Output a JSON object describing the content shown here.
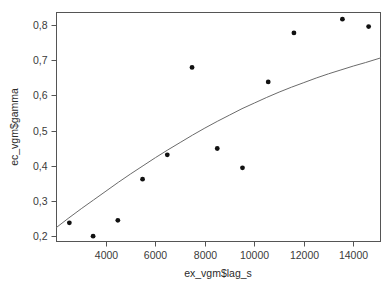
{
  "chart_data": {
    "type": "scatter",
    "title": "",
    "xlabel": "ex_vgm$lag_s",
    "ylabel": "ec_vgm$gamma",
    "xlim": [
      2000,
      15100
    ],
    "ylim": [
      0.185,
      0.835
    ],
    "grid": false,
    "legend": null,
    "decimal_separator": ",",
    "xticks": [
      4000,
      6000,
      8000,
      10000,
      12000,
      14000
    ],
    "xtick_labels": [
      "4000",
      "6000",
      "8000",
      "10000",
      "12000",
      "14000"
    ],
    "yticks": [
      0.2,
      0.3,
      0.4,
      0.5,
      0.6,
      0.7,
      0.8
    ],
    "ytick_labels": [
      "0,2",
      "0,3",
      "0,4",
      "0,5",
      "0,6",
      "0,7",
      "0,8"
    ],
    "series": [
      {
        "name": "empirical variogram",
        "type": "scatter",
        "marker": "filled-circle",
        "color": "#111111",
        "x": [
          2520,
          3480,
          4480,
          5480,
          6480,
          7480,
          8500,
          9520,
          10560,
          11600,
          13560,
          14620
        ],
        "y": [
          0.238,
          0.2,
          0.245,
          0.362,
          0.431,
          0.679,
          0.449,
          0.394,
          0.638,
          0.777,
          0.816,
          0.795
        ]
      },
      {
        "name": "fitted variogram model",
        "type": "line",
        "color": "#6b6b6b",
        "x": [
          2000,
          2500,
          3000,
          3500,
          4000,
          4500,
          5000,
          5500,
          6000,
          6500,
          7000,
          7500,
          8000,
          8500,
          9000,
          9500,
          10000,
          10500,
          11000,
          11500,
          12000,
          12500,
          13000,
          13500,
          14000,
          14500,
          15100
        ],
        "y": [
          0.225,
          0.252,
          0.278,
          0.303,
          0.328,
          0.353,
          0.377,
          0.4,
          0.423,
          0.445,
          0.466,
          0.487,
          0.507,
          0.526,
          0.544,
          0.562,
          0.578,
          0.594,
          0.609,
          0.623,
          0.636,
          0.649,
          0.661,
          0.672,
          0.683,
          0.693,
          0.706
        ]
      }
    ]
  },
  "axes": {
    "x_title": "ex_vgm$lag_s",
    "y_title": "ec_vgm$gamma"
  }
}
